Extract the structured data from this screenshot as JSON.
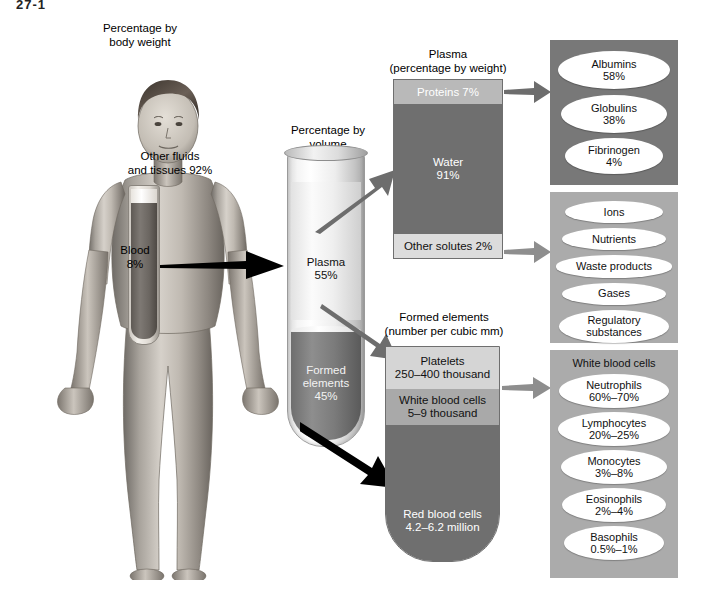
{
  "figure": {
    "marker": "27-1"
  },
  "body_panel": {
    "caption_line1": "Percentage by",
    "caption_line2": "body weight",
    "label_other_line1": "Other fluids",
    "label_other_line2": "and tissues 92%",
    "label_blood_line1": "Blood",
    "label_blood_line2": "8%"
  },
  "tube_panel": {
    "caption_line1": "Percentage by",
    "caption_line2": "volume",
    "plasma_name": "Plasma",
    "plasma_value": "55%",
    "formed_name_line1": "Formed",
    "formed_name_line2": "elements",
    "formed_value": "45%"
  },
  "plasma_box": {
    "caption_line1": "Plasma",
    "caption_line2": "(percentage by weight)",
    "segments": [
      {
        "label": "Proteins 7%"
      },
      {
        "label": "Water",
        "value": "91%"
      },
      {
        "label": "Other solutes 2%"
      }
    ]
  },
  "formed_box": {
    "caption_line1": "Formed elements",
    "caption_line2": "(number per cubic mm)",
    "segments": [
      {
        "label": "Platelets",
        "value": "250–400 thousand"
      },
      {
        "label": "White blood cells",
        "value": "5–9 thousand"
      },
      {
        "label": "Red blood cells",
        "value": "4.2–6.2 million"
      }
    ]
  },
  "panel_proteins": {
    "items": [
      {
        "name": "Albumins",
        "value": "58%"
      },
      {
        "name": "Globulins",
        "value": "38%"
      },
      {
        "name": "Fibrinogen",
        "value": "4%"
      }
    ]
  },
  "panel_solutes": {
    "items": [
      {
        "name": "Ions",
        "value": ""
      },
      {
        "name": "Nutrients",
        "value": ""
      },
      {
        "name": "Waste products",
        "value": ""
      },
      {
        "name": "Gases",
        "value": ""
      },
      {
        "name": "Regulatory",
        "value": "substances"
      }
    ]
  },
  "panel_wbc": {
    "title": "White blood cells",
    "items": [
      {
        "name": "Neutrophils",
        "value": "60%–70%"
      },
      {
        "name": "Lymphocytes",
        "value": "20%–25%"
      },
      {
        "name": "Monocytes",
        "value": "3%–8%"
      },
      {
        "name": "Eosinophils",
        "value": "2%–4%"
      },
      {
        "name": "Basophils",
        "value": "0.5%–1%"
      }
    ]
  },
  "colors": {
    "panel_dark": "#787878",
    "panel_light": "#ababab",
    "segment_dark": "#6f6f6f",
    "segment_mid": "#a9a9a9",
    "segment_light": "#d5d5d5",
    "arrow_black": "#000000",
    "arrow_gray": "#8a8a8a"
  }
}
